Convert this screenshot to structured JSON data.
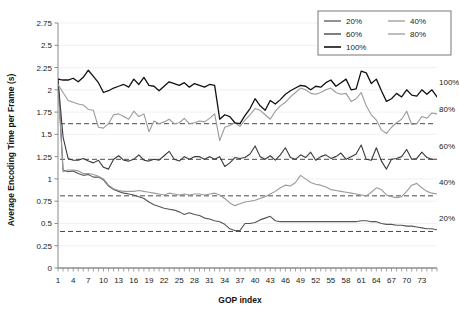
{
  "chart_data": {
    "type": "line",
    "title": "",
    "xlabel": "GOP index",
    "ylabel": "Average Encoding Time per Frame (s)",
    "xlim": [
      1,
      76
    ],
    "ylim": [
      0,
      2.75
    ],
    "ytick_step": 0.25,
    "yticks": [
      "0",
      "0.25",
      "0.5",
      "0.75",
      "1",
      "1.25",
      "1.5",
      "1.75",
      "2",
      "2.25",
      "2.5",
      "2.75"
    ],
    "xticks": [
      "1",
      "4",
      "7",
      "10",
      "13",
      "16",
      "19",
      "22",
      "25",
      "28",
      "31",
      "34",
      "37",
      "40",
      "43",
      "46",
      "49",
      "52",
      "55",
      "58",
      "61",
      "64",
      "67",
      "70",
      "73"
    ],
    "xtick_values": [
      1,
      4,
      7,
      10,
      13,
      16,
      19,
      22,
      25,
      28,
      31,
      34,
      37,
      40,
      43,
      46,
      49,
      52,
      55,
      58,
      61,
      64,
      67,
      70,
      73
    ],
    "grid": "horizontal-light",
    "legend_position": "top-right",
    "legend_columns": 2,
    "x": [
      1,
      2,
      3,
      4,
      5,
      6,
      7,
      8,
      9,
      10,
      11,
      12,
      13,
      14,
      15,
      16,
      17,
      18,
      19,
      20,
      21,
      22,
      23,
      24,
      25,
      26,
      27,
      28,
      29,
      30,
      31,
      32,
      33,
      34,
      35,
      36,
      37,
      38,
      39,
      40,
      41,
      42,
      43,
      44,
      45,
      46,
      47,
      48,
      49,
      50,
      51,
      52,
      53,
      54,
      55,
      56,
      57,
      58,
      59,
      60,
      61,
      62,
      63,
      64,
      65,
      66,
      67,
      68,
      69,
      70,
      71,
      72,
      73,
      74,
      75,
      76
    ],
    "series": [
      {
        "name": "20%",
        "color": "#555555",
        "width": 1.1,
        "mean_line": 0.41,
        "values": [
          2.12,
          1.1,
          1.08,
          1.09,
          1.06,
          1.04,
          1.05,
          1.02,
          1.02,
          0.99,
          0.92,
          0.88,
          0.86,
          0.84,
          0.83,
          0.82,
          0.8,
          0.78,
          0.74,
          0.71,
          0.69,
          0.67,
          0.66,
          0.65,
          0.63,
          0.6,
          0.62,
          0.6,
          0.59,
          0.56,
          0.55,
          0.53,
          0.52,
          0.49,
          0.44,
          0.42,
          0.42,
          0.5,
          0.5,
          0.51,
          0.54,
          0.56,
          0.58,
          0.53,
          0.52,
          0.52,
          0.52,
          0.52,
          0.52,
          0.52,
          0.52,
          0.52,
          0.52,
          0.52,
          0.52,
          0.52,
          0.52,
          0.52,
          0.52,
          0.52,
          0.53,
          0.53,
          0.52,
          0.52,
          0.5,
          0.49,
          0.49,
          0.48,
          0.48,
          0.47,
          0.47,
          0.46,
          0.45,
          0.44,
          0.44,
          0.43
        ]
      },
      {
        "name": "40%",
        "color": "#9a9a9a",
        "width": 1.1,
        "mean_line": 0.81,
        "values": [
          2.08,
          1.08,
          1.1,
          1.1,
          1.09,
          1.06,
          1.06,
          1.05,
          1.03,
          1.0,
          0.93,
          0.89,
          0.87,
          0.86,
          0.86,
          0.86,
          0.87,
          0.86,
          0.85,
          0.84,
          0.83,
          0.82,
          0.84,
          0.83,
          0.82,
          0.83,
          0.82,
          0.83,
          0.83,
          0.82,
          0.83,
          0.84,
          0.82,
          0.78,
          0.73,
          0.7,
          0.72,
          0.74,
          0.75,
          0.76,
          0.78,
          0.8,
          0.83,
          0.86,
          0.9,
          0.93,
          0.92,
          0.96,
          1.04,
          1.0,
          0.96,
          0.94,
          0.93,
          0.91,
          0.88,
          0.87,
          0.86,
          0.85,
          0.84,
          0.83,
          0.82,
          0.81,
          0.85,
          0.9,
          0.88,
          0.82,
          0.8,
          0.79,
          0.8,
          0.86,
          0.93,
          0.95,
          0.9,
          0.86,
          0.84,
          0.83
        ]
      },
      {
        "name": "60%",
        "color": "#3a3a3a",
        "width": 1.1,
        "mean_line": 1.22,
        "values": [
          2.11,
          1.47,
          1.23,
          1.21,
          1.21,
          1.23,
          1.2,
          1.18,
          1.21,
          1.13,
          1.11,
          1.22,
          1.26,
          1.21,
          1.2,
          1.22,
          1.27,
          1.21,
          1.2,
          1.22,
          1.21,
          1.26,
          1.31,
          1.22,
          1.2,
          1.25,
          1.22,
          1.25,
          1.25,
          1.22,
          1.25,
          1.22,
          1.25,
          1.14,
          1.18,
          1.24,
          1.23,
          1.24,
          1.28,
          1.37,
          1.25,
          1.22,
          1.26,
          1.21,
          1.27,
          1.35,
          1.24,
          1.22,
          1.27,
          1.24,
          1.3,
          1.21,
          1.25,
          1.27,
          1.23,
          1.25,
          1.29,
          1.22,
          1.25,
          1.28,
          1.38,
          1.22,
          1.21,
          1.35,
          1.2,
          1.11,
          1.22,
          1.23,
          1.25,
          1.33,
          1.22,
          1.23,
          1.3,
          1.24,
          1.22,
          1.22
        ]
      },
      {
        "name": "80%",
        "color": "#9a9a9a",
        "width": 1.1,
        "mean_line": 1.62,
        "values": [
          2.06,
          1.97,
          1.88,
          1.86,
          1.84,
          1.83,
          1.78,
          1.77,
          1.58,
          1.57,
          1.62,
          1.72,
          1.73,
          1.7,
          1.67,
          1.76,
          1.7,
          1.73,
          1.53,
          1.65,
          1.62,
          1.64,
          1.67,
          1.62,
          1.63,
          1.68,
          1.62,
          1.63,
          1.65,
          1.64,
          1.68,
          1.73,
          1.43,
          1.58,
          1.6,
          1.63,
          1.59,
          1.66,
          1.72,
          1.79,
          1.77,
          1.72,
          1.67,
          1.76,
          1.82,
          1.86,
          1.92,
          1.97,
          2.02,
          2.0,
          1.96,
          1.95,
          1.97,
          2.0,
          2.02,
          1.97,
          1.95,
          1.96,
          1.87,
          1.9,
          1.97,
          1.82,
          1.72,
          1.66,
          1.55,
          1.51,
          1.58,
          1.63,
          1.67,
          1.76,
          1.61,
          1.62,
          1.7,
          1.68,
          1.74,
          1.73
        ]
      },
      {
        "name": "100%",
        "color": "#111111",
        "width": 1.3,
        "mean_line": null,
        "values": [
          2.12,
          2.11,
          2.11,
          2.13,
          2.09,
          2.14,
          2.22,
          2.15,
          2.08,
          1.97,
          1.99,
          2.02,
          2.04,
          2.06,
          2.03,
          2.12,
          2.06,
          2.14,
          2.05,
          2.04,
          1.99,
          2.04,
          2.09,
          2.07,
          2.05,
          2.08,
          2.03,
          2.07,
          2.05,
          2.03,
          2.06,
          2.05,
          1.67,
          1.72,
          1.7,
          1.63,
          1.62,
          1.71,
          1.79,
          1.9,
          1.82,
          1.77,
          1.88,
          1.84,
          1.89,
          1.95,
          1.99,
          2.02,
          2.05,
          2.04,
          2.0,
          2.04,
          2.03,
          2.08,
          2.11,
          2.04,
          2.08,
          2.12,
          2.0,
          2.01,
          2.21,
          2.19,
          2.07,
          2.12,
          1.99,
          1.87,
          1.9,
          1.96,
          1.92,
          2.0,
          1.94,
          1.93,
          2.0,
          1.95,
          2.0,
          1.92
        ]
      }
    ],
    "annotations": [
      {
        "label": "100%",
        "y": 2.09
      },
      {
        "label": "80%",
        "y": 1.78
      },
      {
        "label": "60%",
        "y": 1.37
      },
      {
        "label": "40%",
        "y": 0.96
      },
      {
        "label": "20%",
        "y": 0.56
      }
    ],
    "legend": [
      {
        "label": "20%",
        "color": "#555555"
      },
      {
        "label": "40%",
        "color": "#9a9a9a"
      },
      {
        "label": "60%",
        "color": "#3a3a3a"
      },
      {
        "label": "80%",
        "color": "#9a9a9a"
      },
      {
        "label": "100%",
        "color": "#111111"
      }
    ]
  }
}
